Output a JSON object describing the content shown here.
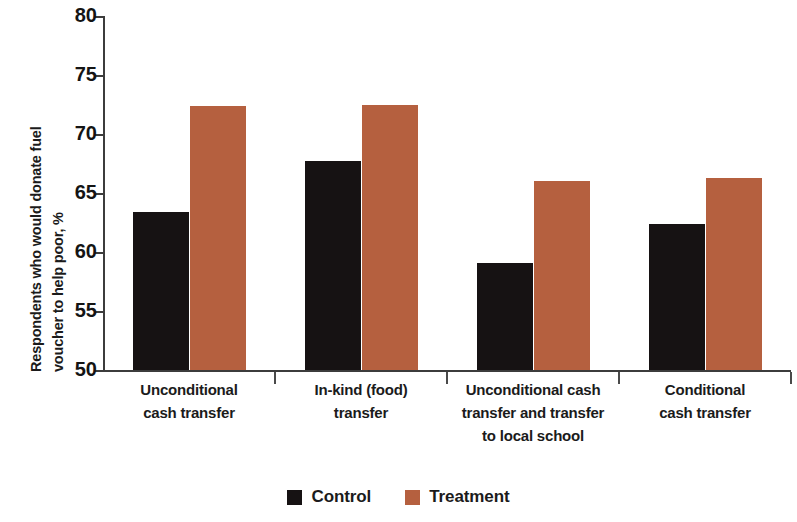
{
  "chart_data": {
    "type": "bar",
    "title": "",
    "subtitle": "",
    "xlabel": "",
    "ylabel_line1": "Respondents who would donate fuel",
    "ylabel_line2": "voucher to help poor, %",
    "ylim": [
      50,
      80
    ],
    "yticks": [
      50,
      55,
      60,
      65,
      70,
      75,
      80
    ],
    "ytick_labels": [
      "50",
      "55",
      "60",
      "65",
      "70",
      "75",
      "80"
    ],
    "grid": false,
    "legend_position": "bottom-center",
    "categories": [
      "Unconditional\ncash transfer",
      "In-kind (food)\ntransfer",
      "Unconditional cash\ntransfer and transfer\nto local school",
      "Conditional\ncash transfer"
    ],
    "category_lines": [
      [
        "Unconditional",
        "cash transfer"
      ],
      [
        "In-kind (food)",
        "transfer"
      ],
      [
        "Unconditional cash",
        "transfer and transfer",
        "to local school"
      ],
      [
        "Conditional",
        "cash transfer"
      ]
    ],
    "series": [
      {
        "name": "Control",
        "color": "#161213",
        "values": [
          63.4,
          67.7,
          59.1,
          62.4
        ]
      },
      {
        "name": "Treatment",
        "color": "#b5603f",
        "values": [
          72.4,
          72.5,
          66.0,
          66.3
        ]
      }
    ]
  },
  "legend": {
    "items": [
      {
        "label": "Control",
        "color": "#161213"
      },
      {
        "label": "Treatment",
        "color": "#b5603f"
      }
    ]
  },
  "axis": {
    "y_ticks": [
      {
        "label": "80",
        "value": 80
      },
      {
        "label": "75",
        "value": 75
      },
      {
        "label": "70",
        "value": 70
      },
      {
        "label": "65",
        "value": 65
      },
      {
        "label": "60",
        "value": 60
      },
      {
        "label": "55",
        "value": 55
      },
      {
        "label": "50",
        "value": 50
      }
    ]
  }
}
